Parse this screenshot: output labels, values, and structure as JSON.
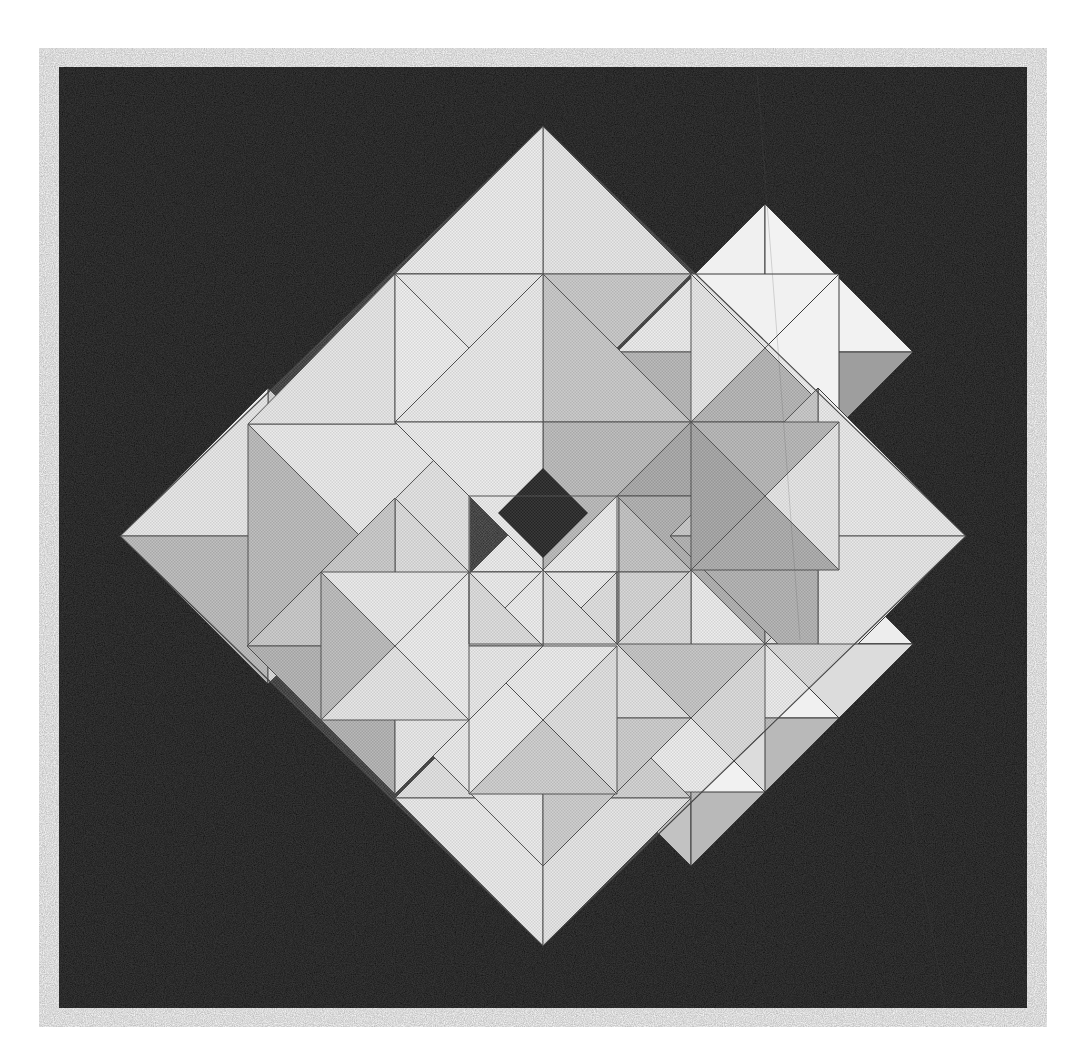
{
  "artwork": {
    "title": "Pinwheel Diamond Tessellation",
    "medium": "halftone screened print",
    "canvas": {
      "width": 1088,
      "height": 1063,
      "background_color": "#ffffff"
    },
    "plate": {
      "name": "black-plate",
      "x": 59,
      "y": 67,
      "width": 968,
      "height": 941,
      "color": "#0d0d0d"
    },
    "palette": {
      "background": "#0d0d0d",
      "paper": "#ffffff",
      "tone_1": "#f2f2f2",
      "tone_2": "#e4e4e4",
      "tone_3": "#d4d4d4",
      "tone_4": "#c2c2c2",
      "tone_5": "#ababab",
      "tone_6": "#9a9a9a",
      "stroke": "#3a3a3a"
    },
    "composition": {
      "shape": "diamond",
      "center_x": 543,
      "center_y": 536,
      "half_width": 423,
      "half_height": 410,
      "tile_count": 8,
      "rotation_degrees": 45,
      "center_hole": "dark square aperture at figure center",
      "symmetry": "4-fold rotational pinwheel"
    },
    "tiles": [
      {
        "id": "tile-n",
        "label": "north square",
        "cx": 543,
        "cy": 330,
        "r": 148,
        "rot": 45,
        "tones": [
          "tone_2",
          "tone_1",
          "tone_4",
          "tone_2"
        ]
      },
      {
        "id": "tile-ne",
        "label": "north-east square",
        "cx": 747,
        "cy": 437,
        "r": 118,
        "rot": 0,
        "tones": [
          "tone_1",
          "tone_6",
          "tone_5",
          "tone_1"
        ]
      },
      {
        "id": "tile-e",
        "label": "east square",
        "cx": 766,
        "cy": 640,
        "r": 148,
        "rot": 45,
        "tones": [
          "tone_4",
          "tone_2",
          "tone_1",
          "tone_5"
        ]
      },
      {
        "id": "tile-se",
        "label": "south-east square",
        "cx": 645,
        "cy": 750,
        "r": 118,
        "rot": 0,
        "tones": [
          "tone_1",
          "tone_2",
          "tone_4",
          "tone_3"
        ]
      },
      {
        "id": "tile-s",
        "label": "south square",
        "cx": 543,
        "cy": 742,
        "r": 148,
        "rot": 45,
        "tones": [
          "tone_2",
          "tone_4",
          "tone_2",
          "tone_1"
        ]
      },
      {
        "id": "tile-sw",
        "label": "south-west square",
        "cx": 339,
        "cy": 636,
        "r": 118,
        "rot": 0,
        "tones": [
          "tone_2",
          "tone_1",
          "tone_5",
          "tone_2"
        ]
      },
      {
        "id": "tile-w",
        "label": "west square",
        "cx": 320,
        "cy": 432,
        "r": 148,
        "rot": 45,
        "tones": [
          "tone_1",
          "tone_5",
          "tone_2",
          "tone_3"
        ]
      },
      {
        "id": "tile-nw",
        "label": "north-west square",
        "cx": 441,
        "cy": 322,
        "r": 118,
        "rot": 0,
        "tones": [
          "tone_2",
          "tone_1",
          "tone_2",
          "tone_1"
        ]
      }
    ],
    "inner_ring": [
      {
        "id": "inner-n",
        "label": "inner north wedge",
        "points": "543,330 690,477 543,624 396,477",
        "tones": [
          "tone_1",
          "tone_5",
          "tone_3",
          "tone_2"
        ]
      },
      {
        "id": "inner-e",
        "label": "inner east wedge",
        "points": "690,477 690,689 478,689 478,477",
        "tones": [
          "tone_5",
          "tone_6",
          "tone_4",
          "tone_3"
        ]
      }
    ],
    "aperture": {
      "label": "center hole",
      "points": "498,513 543,468 588,513 543,558",
      "color": "#0d0d0d"
    }
  }
}
